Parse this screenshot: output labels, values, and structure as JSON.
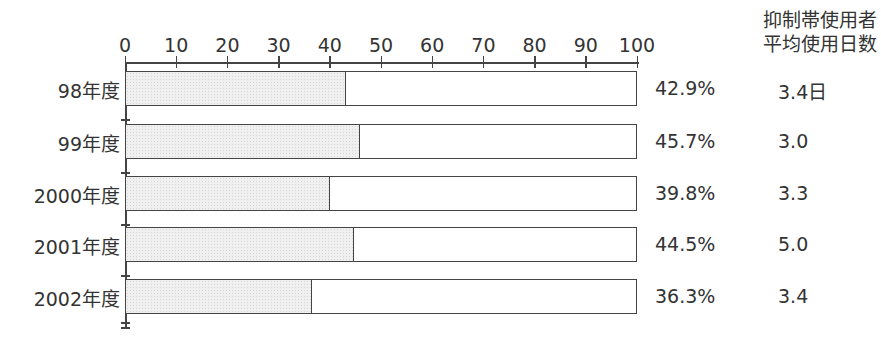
{
  "chart_data": {
    "type": "bar",
    "orientation": "horizontal",
    "stacked_percent": true,
    "categories": [
      "98年度",
      "99年度",
      "2000年度",
      "2001年度",
      "2002年度"
    ],
    "series": [
      {
        "name": "抑制帯使用率",
        "values": [
          42.9,
          45.7,
          39.8,
          44.5,
          36.3
        ]
      }
    ],
    "value_labels": [
      "42.9%",
      "45.7%",
      "39.8%",
      "44.5%",
      "36.3%"
    ],
    "secondary_column": {
      "header": [
        "抑制帯使用者",
        "平均使用日数"
      ],
      "values": [
        "3.4日",
        "3.0",
        "3.3",
        "5.0",
        "3.4"
      ]
    },
    "x_ticks": [
      "0",
      "10",
      "20",
      "30",
      "40",
      "50",
      "60",
      "70",
      "80",
      "90",
      "100"
    ],
    "xlim": [
      0,
      100
    ],
    "axis_position": "top",
    "grid": false,
    "legend": null,
    "title": "",
    "xlabel": "",
    "ylabel": "",
    "colors": {
      "fill": "#ececec",
      "border": "#444444",
      "background": "#ffffff"
    }
  }
}
